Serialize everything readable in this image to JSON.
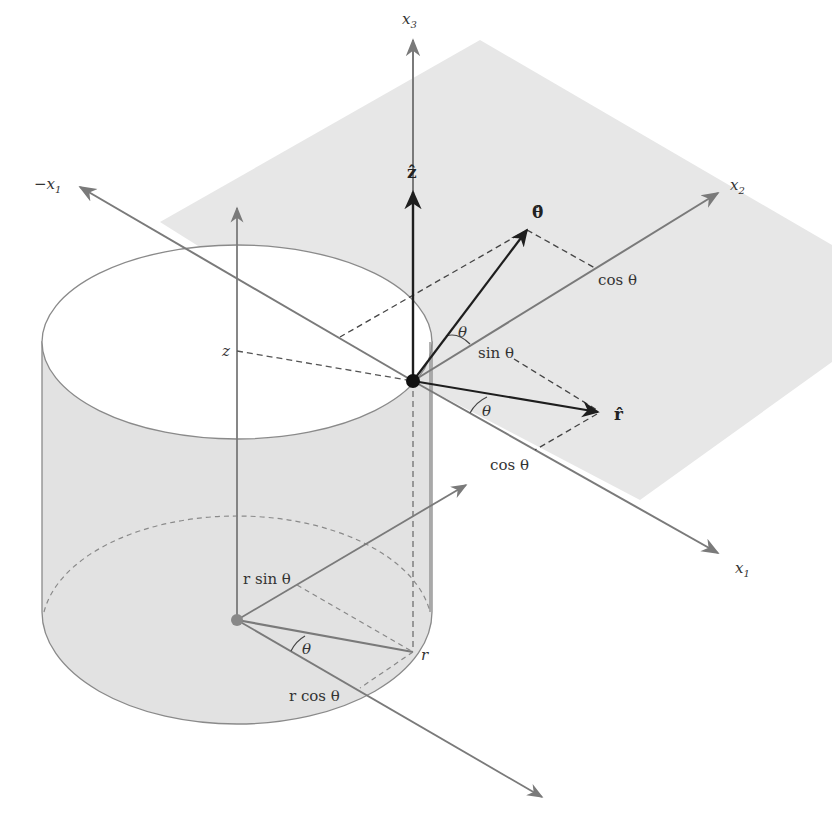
{
  "figure": {
    "colors": {
      "axis": "#7a7a7a",
      "vector": "#1e1e1e",
      "plane_fill": "#e6e6e6",
      "cylinder_fill": "#e3e3e3",
      "cylinder_top": "#ffffff",
      "dashed": "#555555"
    },
    "axes": {
      "x3": {
        "label": "x",
        "sub": "3"
      },
      "neg_x1": {
        "label": "−x",
        "sub": "1"
      },
      "x1": {
        "label": "x",
        "sub": "1"
      },
      "x2": {
        "label": "x",
        "sub": "2"
      }
    },
    "vectors": {
      "z_hat": {
        "label": "ẑ"
      },
      "theta_hat": {
        "label": "θ̂"
      },
      "r_hat": {
        "label": "r̂"
      }
    },
    "upper_labels": {
      "cos_theta_x2": "cos θ",
      "theta_angle_upper": "θ",
      "sin_theta_upper": "sin θ",
      "theta_angle_r": "θ",
      "cos_theta_x1": "cos θ",
      "z": "z"
    },
    "lower_labels": {
      "r_sin_theta": "r sin θ",
      "theta_angle_lower": "θ",
      "r": "r",
      "r_cos_theta": "r cos θ"
    }
  }
}
